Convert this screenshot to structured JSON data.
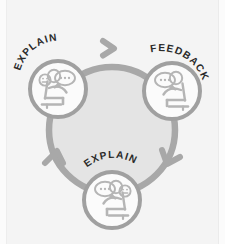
{
  "diagram": {
    "type": "cycle-diagram",
    "direction": "clockwise",
    "background_color": "#f4f4f4",
    "ring_color": "#a8a8a8",
    "ring_fill_color": "#e4e4e4",
    "node_fill_color": "#fbfbfb",
    "node_border_color": "#a0a0a0",
    "figure_color": "#b5b5b5",
    "label_color": "#2a2a2a",
    "nodes": [
      {
        "id": "node-explain-top-left",
        "label": "EXPLAIN",
        "position": "top-left",
        "icon": "person-speaking-icon",
        "figure_orientation": "facing-right",
        "speech_bubble": "•••"
      },
      {
        "id": "node-feedback-top-right",
        "label": "FEEDBACK",
        "position": "top-right",
        "icon": "person-listening-icon",
        "figure_orientation": "facing-left",
        "speech_bubble": "•••"
      },
      {
        "id": "node-explain-bottom",
        "label": "EXPLAIN",
        "position": "bottom-center",
        "icon": "person-speaking-icon",
        "figure_orientation": "facing-left",
        "speech_bubble": "•••"
      }
    ],
    "arrows": [
      {
        "id": "arrow-top",
        "points": "clockwise-right",
        "between": "EXPLAIN → FEEDBACK"
      },
      {
        "id": "arrow-right",
        "points": "clockwise-down",
        "between": "FEEDBACK → EXPLAIN"
      },
      {
        "id": "arrow-left",
        "points": "clockwise-up",
        "between": "EXPLAIN → EXPLAIN"
      }
    ]
  }
}
